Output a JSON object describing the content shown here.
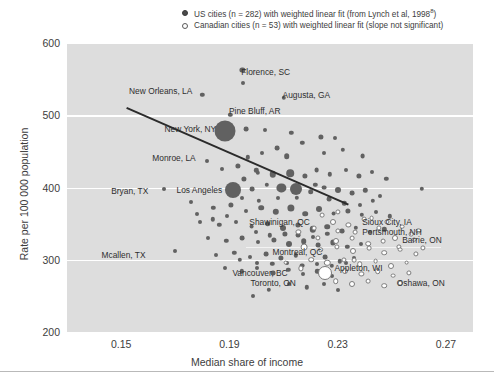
{
  "legend": {
    "us_label": "US cities (n = 282) with weighted linear fit (from Lynch et al, 1998",
    "us_sup": "8",
    "us_tail": ")",
    "ca_label": "Canadian cities (n = 53) with weighted linear fit (slope not significant)"
  },
  "axes": {
    "y_title": "Rate per 100 000 population",
    "x_title": "Median share of income",
    "y_ticks": [
      "600",
      "500",
      "400",
      "300",
      "200"
    ],
    "x_ticks": [
      "0.15",
      "0.19",
      "0.23",
      "0.27"
    ]
  },
  "chart_data": {
    "type": "scatter",
    "title": "",
    "xlabel": "Median share of income",
    "ylabel": "Rate per 100 000 population",
    "xlim": [
      0.13,
      0.28
    ],
    "ylim": [
      200,
      600
    ],
    "x_ticks": [
      0.15,
      0.19,
      0.23,
      0.27
    ],
    "y_ticks": [
      200,
      300,
      400,
      500,
      600
    ],
    "grid": "horizontal-white",
    "legend_position": "top-right",
    "series": [
      {
        "name": "US cities (n = 282) with weighted linear fit (from Lynch et al, 1998)",
        "marker": "filled-circle",
        "color": "#616161",
        "n": 282,
        "fit": {
          "type": "linear",
          "x0": 0.152,
          "y0": 512,
          "x1": 0.234,
          "y1": 378,
          "significant": true
        }
      },
      {
        "name": "Canadian cities (n = 53) with weighted linear fit (slope not significant)",
        "marker": "open-circle",
        "color": "#ffffff",
        "n": 53,
        "fit": {
          "type": "linear",
          "x0": 0.196,
          "y0": 318,
          "x1": 0.268,
          "y1": 318,
          "significant": false
        }
      }
    ],
    "annotations": [
      {
        "label": "Florence, SC",
        "x": 0.1925,
        "y": 560,
        "anchor": "left",
        "group": "US"
      },
      {
        "label": "New Orleans, LA",
        "x": 0.1778,
        "y": 533,
        "anchor": "right",
        "group": "US"
      },
      {
        "label": "Augusta, GA",
        "x": 0.2078,
        "y": 528,
        "anchor": "left",
        "group": "US"
      },
      {
        "label": "Pine Bluff, AR",
        "x": 0.188,
        "y": 506,
        "anchor": "left",
        "group": "US"
      },
      {
        "label": "New York, NY",
        "x": 0.1866,
        "y": 481,
        "anchor": "right",
        "group": "US"
      },
      {
        "label": "Monroe, LA",
        "x": 0.179,
        "y": 441,
        "anchor": "right",
        "group": "US"
      },
      {
        "label": "Bryan, TX",
        "x": 0.1615,
        "y": 395,
        "anchor": "right",
        "group": "US"
      },
      {
        "label": "Los Angeles",
        "x": 0.1888,
        "y": 396,
        "anchor": "right",
        "group": "US"
      },
      {
        "label": "Shawinigan, QC",
        "x": 0.2212,
        "y": 352,
        "anchor": "right",
        "group": "CA"
      },
      {
        "label": "Sioux City, IA",
        "x": 0.2372,
        "y": 352,
        "anchor": "left",
        "group": "US"
      },
      {
        "label": "Portsmouth, NH",
        "x": 0.2372,
        "y": 338,
        "anchor": "left",
        "group": "US"
      },
      {
        "label": "Barrie, ON",
        "x": 0.252,
        "y": 328,
        "anchor": "left",
        "group": "CA"
      },
      {
        "label": "Mcallen, TX",
        "x": 0.1605,
        "y": 307,
        "anchor": "right",
        "group": "US"
      },
      {
        "label": "Montreal, QC",
        "x": 0.2258,
        "y": 311,
        "anchor": "right",
        "group": "CA"
      },
      {
        "label": "Appleton, WI",
        "x": 0.227,
        "y": 288,
        "anchor": "left",
        "group": "US"
      },
      {
        "label": "Vancouver, BC",
        "x": 0.213,
        "y": 282,
        "anchor": "right",
        "group": "CA"
      },
      {
        "label": "Toronto, ON",
        "x": 0.216,
        "y": 268,
        "anchor": "right",
        "group": "CA"
      },
      {
        "label": "Oshawa, ON",
        "x": 0.25,
        "y": 268,
        "anchor": "left",
        "group": "CA"
      }
    ],
    "points_us": [
      [
        0.1948,
        563,
        2.6
      ],
      [
        0.1952,
        545,
        2.0
      ],
      [
        0.18,
        528,
        2.2
      ],
      [
        0.21,
        524,
        2.2
      ],
      [
        0.1903,
        501,
        2.2
      ],
      [
        0.1885,
        478,
        10.5
      ],
      [
        0.1962,
        481,
        2.4
      ],
      [
        0.2032,
        480,
        2.0
      ],
      [
        0.2128,
        476,
        2.2
      ],
      [
        0.1818,
        437,
        2.0
      ],
      [
        0.2238,
        470,
        2.6
      ],
      [
        0.229,
        468,
        2.0
      ],
      [
        0.217,
        462,
        2.2
      ],
      [
        0.2075,
        455,
        2.4
      ],
      [
        0.202,
        448,
        2.0
      ],
      [
        0.1968,
        442,
        2.2
      ],
      [
        0.2112,
        443,
        2.8
      ],
      [
        0.2248,
        448,
        2.0
      ],
      [
        0.2318,
        452,
        2.2
      ],
      [
        0.2392,
        443,
        2.4
      ],
      [
        0.1872,
        425,
        2.0
      ],
      [
        0.193,
        430,
        2.6
      ],
      [
        0.2,
        424,
        2.2
      ],
      [
        0.206,
        418,
        3.2
      ],
      [
        0.2125,
        420,
        3.8
      ],
      [
        0.218,
        416,
        2.6
      ],
      [
        0.2222,
        424,
        2.4
      ],
      [
        0.2272,
        418,
        2.2
      ],
      [
        0.233,
        424,
        2.0
      ],
      [
        0.2378,
        416,
        2.6
      ],
      [
        0.2428,
        422,
        2.0
      ],
      [
        0.248,
        412,
        2.2
      ],
      [
        0.166,
        398,
        2.0
      ],
      [
        0.1912,
        396,
        8.0
      ],
      [
        0.1985,
        398,
        2.4
      ],
      [
        0.2038,
        404,
        2.2
      ],
      [
        0.2092,
        400,
        4.6
      ],
      [
        0.2145,
        398,
        6.0
      ],
      [
        0.22,
        394,
        2.8
      ],
      [
        0.225,
        400,
        2.4
      ],
      [
        0.23,
        396,
        3.0
      ],
      [
        0.2352,
        392,
        2.4
      ],
      [
        0.2402,
        396,
        2.2
      ],
      [
        0.2455,
        388,
        2.0
      ],
      [
        0.261,
        398,
        2.2
      ],
      [
        0.1758,
        380,
        2.0
      ],
      [
        0.184,
        372,
        2.2
      ],
      [
        0.1905,
        376,
        2.6
      ],
      [
        0.196,
        368,
        2.0
      ],
      [
        0.2018,
        372,
        2.8
      ],
      [
        0.2072,
        366,
        3.2
      ],
      [
        0.2128,
        372,
        3.6
      ],
      [
        0.218,
        364,
        2.8
      ],
      [
        0.2232,
        370,
        3.0
      ],
      [
        0.2285,
        364,
        2.4
      ],
      [
        0.2338,
        368,
        2.6
      ],
      [
        0.239,
        362,
        2.2
      ],
      [
        0.244,
        366,
        2.0
      ],
      [
        0.2492,
        360,
        2.2
      ],
      [
        0.1792,
        352,
        2.0
      ],
      [
        0.1862,
        348,
        2.2
      ],
      [
        0.1925,
        352,
        2.0
      ],
      [
        0.1982,
        346,
        2.4
      ],
      [
        0.2042,
        350,
        2.8
      ],
      [
        0.2098,
        344,
        3.0
      ],
      [
        0.2152,
        348,
        2.6
      ],
      [
        0.2208,
        342,
        3.2
      ],
      [
        0.2262,
        346,
        2.8
      ],
      [
        0.2315,
        340,
        2.4
      ],
      [
        0.2368,
        344,
        2.2
      ],
      [
        0.242,
        338,
        2.0
      ],
      [
        0.2472,
        342,
        2.2
      ],
      [
        0.1822,
        330,
        2.0
      ],
      [
        0.1888,
        326,
        2.2
      ],
      [
        0.1948,
        330,
        2.4
      ],
      [
        0.2005,
        324,
        2.0
      ],
      [
        0.2065,
        328,
        2.6
      ],
      [
        0.212,
        322,
        3.0
      ],
      [
        0.2175,
        326,
        2.8
      ],
      [
        0.2228,
        320,
        2.4
      ],
      [
        0.2282,
        324,
        2.6
      ],
      [
        0.2335,
        318,
        2.2
      ],
      [
        0.2388,
        322,
        2.0
      ],
      [
        0.17,
        312,
        2.0
      ],
      [
        0.1852,
        306,
        2.0
      ],
      [
        0.1918,
        310,
        2.2
      ],
      [
        0.1975,
        304,
        2.0
      ],
      [
        0.2035,
        308,
        2.4
      ],
      [
        0.209,
        302,
        2.6
      ],
      [
        0.2145,
        306,
        2.2
      ],
      [
        0.22,
        300,
        2.0
      ],
      [
        0.2255,
        304,
        2.4
      ],
      [
        0.2308,
        298,
        2.2
      ],
      [
        0.2362,
        302,
        2.0
      ],
      [
        0.1882,
        288,
        2.0
      ],
      [
        0.1945,
        284,
        2.2
      ],
      [
        0.2002,
        288,
        2.0
      ],
      [
        0.2062,
        282,
        2.4
      ],
      [
        0.2118,
        286,
        2.2
      ],
      [
        0.2172,
        280,
        2.0
      ],
      [
        0.2225,
        284,
        2.2
      ],
      [
        0.228,
        278,
        2.0
      ],
      [
        0.2122,
        266,
        2.0
      ],
      [
        0.2185,
        262,
        2.2
      ],
      [
        0.2248,
        266,
        2.0
      ],
      [
        0.2045,
        258,
        2.2
      ],
      [
        0.2302,
        258,
        2.0
      ],
      [
        0.1988,
        250,
        2.0
      ],
      [
        0.2005,
        420,
        2.2
      ],
      [
        0.1955,
        412,
        2.6
      ],
      [
        0.2218,
        404,
        2.2
      ],
      [
        0.2268,
        384,
        2.4
      ],
      [
        0.2148,
        386,
        2.2
      ],
      [
        0.2078,
        386,
        2.0
      ],
      [
        0.2008,
        382,
        2.2
      ],
      [
        0.1948,
        386,
        2.0
      ],
      [
        0.2325,
        378,
        2.2
      ],
      [
        0.2382,
        376,
        2.0
      ],
      [
        0.243,
        382,
        2.2
      ],
      [
        0.189,
        360,
        2.0
      ],
      [
        0.1838,
        356,
        2.2
      ],
      [
        0.1782,
        364,
        2.0
      ],
      [
        0.2155,
        334,
        2.4
      ],
      [
        0.2208,
        332,
        2.0
      ],
      [
        0.2262,
        336,
        2.2
      ],
      [
        0.2105,
        336,
        2.6
      ],
      [
        0.205,
        334,
        2.2
      ],
      [
        0.1998,
        338,
        2.0
      ],
      [
        0.2332,
        296,
        2.0
      ],
      [
        0.2278,
        292,
        2.2
      ],
      [
        0.2222,
        294,
        2.0
      ],
      [
        0.2168,
        292,
        2.4
      ],
      [
        0.2112,
        296,
        2.0
      ],
      [
        0.2058,
        294,
        2.2
      ],
      [
        0.2002,
        296,
        2.0
      ],
      [
        0.1938,
        300,
        2.2
      ]
    ],
    "points_ca": [
      [
        0.2282,
        352,
        3.0
      ],
      [
        0.234,
        348,
        2.6
      ],
      [
        0.2398,
        356,
        2.4
      ],
      [
        0.2452,
        344,
        2.6
      ],
      [
        0.2512,
        330,
        3.0
      ],
      [
        0.257,
        336,
        2.4
      ],
      [
        0.2228,
        330,
        2.6
      ],
      [
        0.2292,
        326,
        3.0
      ],
      [
        0.2352,
        330,
        2.4
      ],
      [
        0.2412,
        322,
        2.8
      ],
      [
        0.2468,
        326,
        2.4
      ],
      [
        0.2525,
        318,
        2.6
      ],
      [
        0.2175,
        318,
        3.4
      ],
      [
        0.2238,
        314,
        2.8
      ],
      [
        0.2298,
        318,
        2.6
      ],
      [
        0.2358,
        312,
        3.0
      ],
      [
        0.2415,
        316,
        2.4
      ],
      [
        0.2472,
        310,
        2.8
      ],
      [
        0.253,
        314,
        2.4
      ],
      [
        0.2588,
        308,
        2.6
      ],
      [
        0.2202,
        300,
        2.8
      ],
      [
        0.2262,
        296,
        3.2
      ],
      [
        0.2322,
        300,
        2.6
      ],
      [
        0.2382,
        294,
        2.8
      ],
      [
        0.244,
        298,
        2.4
      ],
      [
        0.2498,
        292,
        3.0
      ],
      [
        0.2555,
        296,
        2.4
      ],
      [
        0.2255,
        282,
        7.0
      ],
      [
        0.2328,
        284,
        3.0
      ],
      [
        0.2388,
        280,
        2.6
      ],
      [
        0.2448,
        284,
        2.8
      ],
      [
        0.2505,
        278,
        2.4
      ],
      [
        0.2562,
        282,
        2.6
      ],
      [
        0.2292,
        270,
        2.8
      ],
      [
        0.2352,
        266,
        3.0
      ],
      [
        0.2412,
        270,
        2.4
      ],
      [
        0.2472,
        264,
        2.8
      ],
      [
        0.253,
        268,
        2.4
      ],
      [
        0.2155,
        338,
        2.6
      ],
      [
        0.2212,
        344,
        2.4
      ],
      [
        0.2165,
        288,
        2.6
      ],
      [
        0.2108,
        296,
        2.4
      ],
      [
        0.2425,
        358,
        2.4
      ],
      [
        0.2482,
        352,
        2.6
      ],
      [
        0.2538,
        346,
        2.4
      ],
      [
        0.2598,
        340,
        2.6
      ],
      [
        0.2365,
        338,
        2.4
      ],
      [
        0.2302,
        340,
        2.6
      ],
      [
        0.2242,
        362,
        2.4
      ],
      [
        0.2302,
        366,
        2.6
      ],
      [
        0.2362,
        300,
        2.4
      ],
      [
        0.2582,
        328,
        2.4
      ],
      [
        0.2615,
        316,
        2.6
      ]
    ]
  }
}
